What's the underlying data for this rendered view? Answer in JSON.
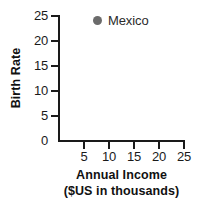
{
  "chart_data": {
    "type": "scatter",
    "title": "",
    "xlabel": "Annual Income",
    "xlabel_sub": "($US in thousands)",
    "ylabel": "Birth Rate",
    "xlim": [
      0,
      25
    ],
    "ylim": [
      0,
      25
    ],
    "xticks": [
      5,
      10,
      15,
      20,
      25
    ],
    "yticks": [
      0,
      5,
      10,
      15,
      20,
      25
    ],
    "xtick_labels": [
      "5",
      "10",
      "15",
      "20",
      "25"
    ],
    "ytick_labels": [
      "0",
      "5",
      "10",
      "15",
      "20",
      "25"
    ],
    "grid": false,
    "legend_position": "top-center",
    "marker_color": "#6b6b6b",
    "axis_color": "#1a1a1a",
    "background_color": "#ffffff",
    "series": [
      {
        "name": "Mexico",
        "marker": "circle",
        "color": "#6b6b6b",
        "x": [],
        "y": [],
        "points": []
      }
    ],
    "annotations": []
  },
  "legend": {
    "entries": [
      {
        "label": "Mexico",
        "marker_icon": "filled-circle-marker",
        "color": "#6b6b6b"
      }
    ]
  },
  "axes": {
    "y": {
      "title": "Birth Rate",
      "labels": [
        "25",
        "20",
        "15",
        "10",
        "5",
        "0"
      ]
    },
    "x": {
      "title_line1": "Annual Income",
      "title_line2": "($US in thousands)",
      "labels": [
        "5",
        "10",
        "15",
        "20",
        "25"
      ]
    }
  }
}
